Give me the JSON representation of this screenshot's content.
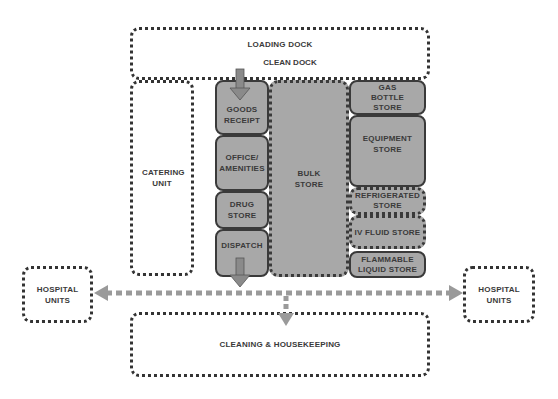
{
  "diagram": {
    "colors": {
      "background": "#ffffff",
      "store_fill": "#a8a8a8",
      "border": "#333333",
      "arrow": "#8a8a8a",
      "text": "#3a3a3a"
    },
    "zones": {
      "loading_dock": "LOADING DOCK",
      "clean_dock": "CLEAN DOCK",
      "catering_unit": "CATERING UNIT",
      "goods_receipt": "GOODS RECEIPT",
      "office_amenities": "OFFICE/ AMENITIES",
      "drug_store": "DRUG STORE",
      "dispatch": "DISPATCH",
      "bulk_store": "BULK STORE",
      "gas_bottle_store": "GAS BOTTLE STORE",
      "equipment_store": "EQUIPMENT STORE",
      "refrigerated_store": "REFRIGERATED STORE",
      "iv_fluid_store": "IV FLUID STORE",
      "flammable_liquid_store": "FLAMMABLE LIQUID STORE",
      "hospital_units_left": "HOSPITAL UNITS",
      "hospital_units_right": "HOSPITAL UNITS",
      "cleaning_housekeeping": "CLEANING & HOUSEKEEPING"
    },
    "flows": [
      {
        "from": "clean_dock",
        "to": "goods_receipt",
        "style": "solid-arrow"
      },
      {
        "from": "dispatch",
        "to": "distribution-corridor",
        "style": "solid-arrow"
      },
      {
        "from": "distribution-corridor",
        "to": "hospital_units_left",
        "style": "dashed-arrow"
      },
      {
        "from": "distribution-corridor",
        "to": "hospital_units_right",
        "style": "dashed-arrow"
      },
      {
        "from": "distribution-corridor",
        "to": "cleaning_housekeeping",
        "style": "dashed-arrow"
      }
    ]
  }
}
